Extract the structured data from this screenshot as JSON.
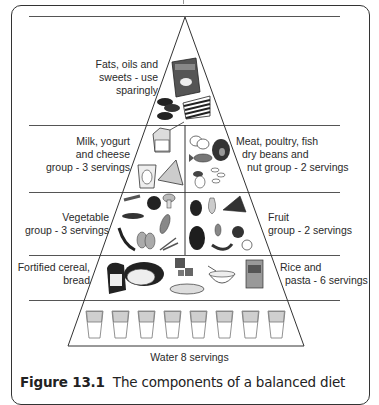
{
  "figure": {
    "number_label": "Figure 13.1",
    "caption_text": "The components of a balanced diet"
  },
  "pyramid": {
    "tiers": [
      {
        "id": "fats",
        "left_label": [
          "Fats, oils and",
          "sweets - use",
          "sparingly"
        ],
        "icons": [
          "chips-bag",
          "cookies",
          "layer-cake"
        ]
      },
      {
        "id": "protein-dairy",
        "left_label": [
          "Milk, yogurt",
          "and cheese",
          "group - 3 servings"
        ],
        "right_label": [
          "Meat, poultry, fish",
          "dry beans and",
          "nut group - 2 servings"
        ],
        "left_icons": [
          "milk-carton",
          "yogurt-cup",
          "cheese-wedge"
        ],
        "right_icons": [
          "eggs",
          "ham",
          "fish",
          "nuts",
          "beans"
        ]
      },
      {
        "id": "veg-fruit",
        "left_label": [
          "Vegetable",
          "group - 3 servings"
        ],
        "right_label": [
          "Fruit",
          "group - 2 servings"
        ],
        "left_icons": [
          "carrot",
          "tomato",
          "mushroom",
          "peas",
          "corn",
          "chili-pepper",
          "garlic",
          "onion"
        ],
        "right_icons": [
          "strawberry",
          "pear",
          "watermelon",
          "grapes",
          "dates",
          "apple",
          "banana",
          "apple-slice"
        ]
      },
      {
        "id": "grains",
        "left_label": [
          "Fortified cereal,",
          "bread"
        ],
        "right_label": [
          "Rice and",
          "pasta - 6 servings"
        ],
        "icons": [
          "bread-loaf",
          "round-loaf",
          "crackers",
          "pasta-dish",
          "rice-bowl",
          "cereal-box"
        ]
      },
      {
        "id": "water",
        "bottom_label": "Water 8 servings",
        "glass_count": 8
      }
    ]
  },
  "colors": {
    "line": "#333333",
    "divider": "#555555",
    "water_fill": "#cfcfcf",
    "food_dark": "#2b2b2b",
    "food_mid": "#8a8a8a",
    "food_light": "#d9d9d9"
  }
}
